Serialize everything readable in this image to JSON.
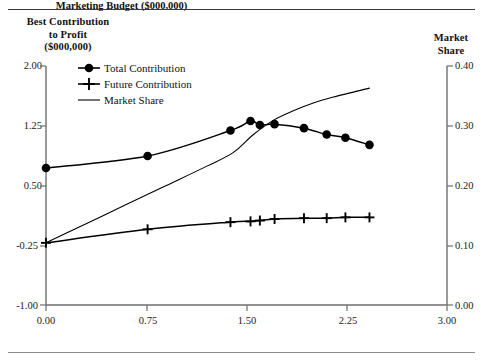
{
  "figure": {
    "left_axis_title": "Best Contribution\nto Profit\n($000,000)",
    "right_axis_title": "Market\nShare",
    "x_axis_title": "Marketing Budget ($000,000)"
  },
  "legend": {
    "items": [
      {
        "label": "Total Contribution",
        "marker": "filled-circle-marker"
      },
      {
        "label": "Future Contribution",
        "marker": "plus-marker"
      },
      {
        "label": "Market Share",
        "marker": "line-marker"
      }
    ]
  },
  "axes": {
    "left_ticks": [
      "2.00",
      "1.25",
      "0.50",
      "-0.25",
      "-1.00"
    ],
    "right_ticks": [
      "0.40",
      "0.30",
      "0.20",
      "0.10",
      "0.00"
    ],
    "x_ticks": [
      "0.00",
      "0.75",
      "1.50",
      "2.25",
      "3.00"
    ]
  },
  "chart_data": {
    "type": "line",
    "title": "",
    "xlabel": "Marketing Budget ($000,000)",
    "ylabel": "Best Contribution to Profit ($000,000)",
    "y2label": "Market Share",
    "xlim": [
      0.0,
      3.0
    ],
    "ylim": [
      -1.0,
      2.0
    ],
    "y2lim": [
      0.0,
      0.4
    ],
    "xticks": [
      0.0,
      0.75,
      1.5,
      2.25,
      3.0
    ],
    "yticks": [
      -1.0,
      -0.25,
      0.5,
      1.25,
      2.0
    ],
    "y2ticks": [
      0.0,
      0.1,
      0.2,
      0.3,
      0.4
    ],
    "grid": false,
    "legend_position": "upper-left-inside",
    "series": [
      {
        "name": "Total Contribution",
        "axis": "left",
        "marker": "filled-circle",
        "x": [
          0.0,
          0.76,
          1.38,
          1.53,
          1.6,
          1.71,
          1.93,
          2.1,
          2.24,
          2.42
        ],
        "y": [
          0.72,
          0.87,
          1.19,
          1.31,
          1.26,
          1.27,
          1.22,
          1.14,
          1.1,
          1.01
        ]
      },
      {
        "name": "Future Contribution",
        "axis": "left",
        "marker": "plus",
        "x": [
          0.0,
          0.76,
          1.38,
          1.53,
          1.6,
          1.71,
          1.93,
          2.1,
          2.24,
          2.42
        ],
        "y": [
          -0.22,
          -0.05,
          0.04,
          0.05,
          0.06,
          0.08,
          0.09,
          0.09,
          0.1,
          0.1
        ]
      },
      {
        "name": "Market Share",
        "axis": "right",
        "marker": "none",
        "x": [
          0.0,
          0.3,
          0.6,
          0.9,
          1.2,
          1.4,
          1.55,
          1.7,
          1.85,
          2.0,
          2.15,
          2.42
        ],
        "y": [
          0.104,
          0.136,
          0.168,
          0.2,
          0.232,
          0.255,
          0.285,
          0.309,
          0.325,
          0.338,
          0.348,
          0.363
        ]
      }
    ]
  }
}
